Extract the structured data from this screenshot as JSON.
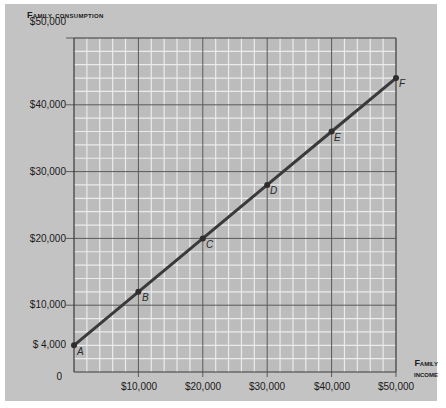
{
  "chart_data": {
    "type": "line",
    "title": "",
    "xlabel": "Family income",
    "ylabel": "Family consumption",
    "x": [
      0,
      10000,
      20000,
      30000,
      40000,
      50000
    ],
    "series": [
      {
        "name": "Consumption function",
        "values": [
          4000,
          12000,
          20000,
          28000,
          36000,
          44000
        ],
        "point_labels": [
          "A",
          "B",
          "C",
          "D",
          "E",
          "F"
        ],
        "color": "#3a3a3a"
      }
    ],
    "xlim": [
      0,
      50000
    ],
    "ylim": [
      0,
      50000
    ],
    "x_tick_labels": [
      "$10,000",
      "$20,000",
      "$30,000",
      "$40,000",
      "$50,000"
    ],
    "y_tick_labels": [
      "0",
      "$ 4,000",
      "$10,000",
      "$20,000",
      "$30,000",
      "$40,000",
      "$50,000"
    ],
    "grid": true,
    "minor_grid_subdivisions": 5,
    "legend": "none"
  },
  "labels": {
    "y_axis_title": "Family consumption",
    "x_axis_title_line1": "Family",
    "x_axis_title_line2": "income",
    "y_zero": "0",
    "y_4000": "$ 4,000",
    "y_10000": "$10,000",
    "y_20000": "$20,000",
    "y_30000": "$30,000",
    "y_40000": "$40,000",
    "y_50000": "$50,000",
    "x_10000": "$10,000",
    "x_20000": "$20,000",
    "x_30000": "$30,000",
    "x_40000": "$40,000",
    "x_50000": "$50,000",
    "point_a": "A",
    "point_b": "B",
    "point_c": "C",
    "point_d": "D",
    "point_e": "E",
    "point_f": "F"
  },
  "colors": {
    "panel_bg": "#c3c3c3",
    "plot_bg": "#bcbcbc",
    "minor_grid": "#e8e8e8",
    "major_grid": "#5a5a5a",
    "line": "#3a3a3a"
  }
}
